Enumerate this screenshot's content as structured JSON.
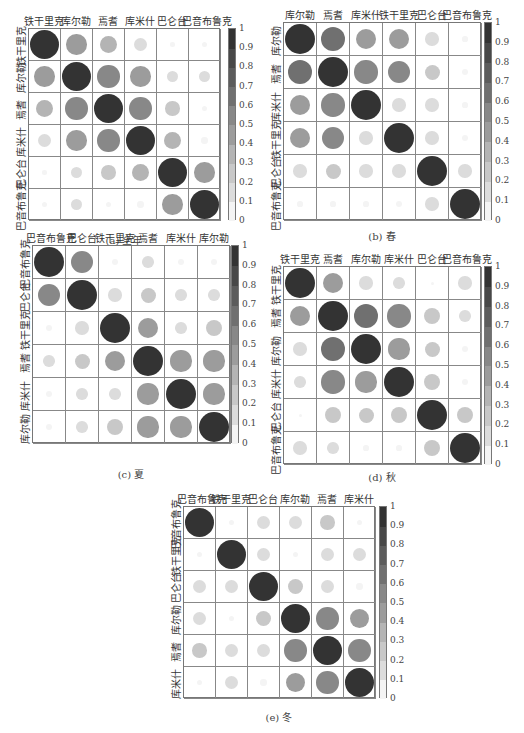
{
  "colorbar": {
    "ticks": [
      "1",
      "0.9",
      "0.8",
      "0.7",
      "0.6",
      "0.5",
      "0.4",
      "0.3",
      "0.2",
      "0.1",
      "0"
    ],
    "colors": [
      "#f4f4f4",
      "#dcdcdc",
      "#c8c8c8",
      "#b4b4b4",
      "#9c9c9c",
      "#888888",
      "#707070",
      "#5c5c5c",
      "#484848",
      "#333333"
    ]
  },
  "chart_data": [
    {
      "type": "heatmap",
      "title": "(a) 全年",
      "labels": [
        "铁干里克",
        "库尔勒",
        "焉耆",
        "库米什",
        "巴仑台",
        "巴音布鲁克"
      ],
      "matrix": [
        [
          1.0,
          0.5,
          0.35,
          0.2,
          0.02,
          0.03
        ],
        [
          0.5,
          1.0,
          0.6,
          0.5,
          0.15,
          0.15
        ],
        [
          0.35,
          0.6,
          1.0,
          0.6,
          0.25,
          0.03
        ],
        [
          0.2,
          0.5,
          0.6,
          1.0,
          0.35,
          0.05
        ],
        [
          0.02,
          0.15,
          0.25,
          0.35,
          1.0,
          0.5
        ],
        [
          0.03,
          0.15,
          0.03,
          0.05,
          0.5,
          1.0
        ]
      ],
      "colorbar_range": [
        0,
        1
      ]
    },
    {
      "type": "heatmap",
      "title": "(b) 春",
      "labels": [
        "库尔勒",
        "焉耆",
        "库米什",
        "铁干里克",
        "巴仑台",
        "巴音布鲁克"
      ],
      "matrix": [
        [
          1.0,
          0.65,
          0.45,
          0.45,
          0.2,
          0.03
        ],
        [
          0.65,
          1.0,
          0.6,
          0.55,
          0.25,
          0.05
        ],
        [
          0.45,
          0.6,
          1.0,
          0.2,
          0.2,
          0.03
        ],
        [
          0.45,
          0.55,
          0.2,
          1.0,
          0.2,
          0.05
        ],
        [
          0.2,
          0.25,
          0.2,
          0.2,
          1.0,
          0.2
        ],
        [
          0.03,
          0.03,
          0.03,
          0.05,
          0.2,
          1.0
        ]
      ],
      "colorbar_range": [
        0,
        1
      ]
    },
    {
      "type": "heatmap",
      "title": "(c) 夏",
      "labels": [
        "巴音布鲁克",
        "巴仑台",
        "铁干里克",
        "焉耆",
        "库米什",
        "库尔勒"
      ],
      "matrix": [
        [
          1.0,
          0.55,
          0.05,
          0.15,
          0.05,
          0.05
        ],
        [
          0.55,
          1.0,
          0.2,
          0.25,
          0.15,
          0.15
        ],
        [
          0.05,
          0.2,
          1.0,
          0.45,
          0.15,
          0.3
        ],
        [
          0.15,
          0.25,
          0.45,
          1.0,
          0.5,
          0.5
        ],
        [
          0.05,
          0.15,
          0.15,
          0.5,
          1.0,
          0.5
        ],
        [
          0.05,
          0.15,
          0.3,
          0.5,
          0.5,
          1.0
        ]
      ],
      "colorbar_range": [
        0,
        1
      ]
    },
    {
      "type": "heatmap",
      "title": "(d) 秋",
      "labels": [
        "铁干里克",
        "焉耆",
        "库尔勒",
        "库米什",
        "巴仑台",
        "巴音布鲁克"
      ],
      "matrix": [
        [
          1.0,
          0.45,
          0.2,
          0.15,
          0.0,
          0.2
        ],
        [
          0.45,
          1.0,
          0.65,
          0.6,
          0.3,
          0.15
        ],
        [
          0.2,
          0.65,
          1.0,
          0.5,
          0.25,
          0.05
        ],
        [
          0.15,
          0.6,
          0.5,
          1.0,
          0.3,
          0.05
        ],
        [
          0.0,
          0.3,
          0.25,
          0.3,
          1.0,
          0.3
        ],
        [
          0.2,
          0.15,
          0.03,
          0.03,
          0.3,
          1.0
        ]
      ],
      "colorbar_range": [
        0,
        1
      ]
    },
    {
      "type": "heatmap",
      "title": "(e) 冬",
      "labels": [
        "巴音布鲁克",
        "铁干里克",
        "巴仑台",
        "库尔勒",
        "焉耆",
        "库米什"
      ],
      "matrix": [
        [
          1.0,
          0.03,
          0.2,
          0.2,
          0.25,
          0.03
        ],
        [
          0.03,
          1.0,
          0.2,
          0.03,
          0.2,
          0.2
        ],
        [
          0.2,
          0.2,
          1.0,
          0.3,
          0.2,
          0.05
        ],
        [
          0.2,
          0.03,
          0.3,
          1.0,
          0.6,
          0.45
        ],
        [
          0.25,
          0.2,
          0.2,
          0.6,
          1.0,
          0.6
        ],
        [
          0.03,
          0.2,
          0.05,
          0.45,
          0.6,
          1.0
        ]
      ],
      "colorbar_range": [
        0,
        1
      ]
    }
  ],
  "panels": [
    {
      "caption": "(a) 全年",
      "x": 28,
      "y": 28,
      "cell": 32,
      "cbx": 228,
      "capy": 232
    },
    {
      "caption": "(b) 春",
      "x": 283,
      "y": 22,
      "cell": 33,
      "cbx": 484,
      "capy": 228
    },
    {
      "caption": "(c) 夏",
      "x": 32,
      "y": 245,
      "cell": 33,
      "cbx": 231,
      "capy": 466
    },
    {
      "caption": "(d) 秋",
      "x": 283,
      "y": 266,
      "cell": 33,
      "cbx": 484,
      "capy": 469
    },
    {
      "caption": "(e) 冬",
      "x": 183,
      "y": 506,
      "cell": 32,
      "cbx": 379,
      "capy": 709
    }
  ]
}
